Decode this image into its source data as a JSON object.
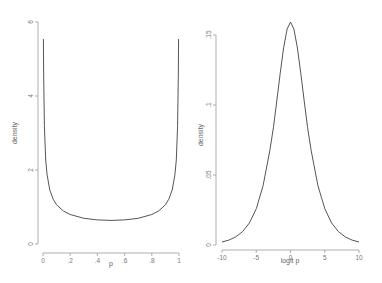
{
  "chart_data": [
    {
      "type": "line",
      "title": "",
      "xlabel": "p",
      "ylabel": "density",
      "xlim": [
        0,
        1
      ],
      "ylim": [
        0,
        6
      ],
      "grid": false,
      "legend": null,
      "x_ticks": [
        {
          "value": 0,
          "label": "0"
        },
        {
          "value": 0.2,
          "label": ".2"
        },
        {
          "value": 0.4,
          "label": ".4"
        },
        {
          "value": 0.6,
          "label": ".6"
        },
        {
          "value": 0.8,
          "label": ".8"
        },
        {
          "value": 1,
          "label": "1"
        }
      ],
      "y_ticks": [
        {
          "value": 0,
          "label": "0"
        },
        {
          "value": 2,
          "label": "2"
        },
        {
          "value": 4,
          "label": "4"
        },
        {
          "value": 6,
          "label": "6"
        }
      ],
      "series": [
        {
          "name": "Beta(0.5,0.5) density",
          "x": [
            0.0033,
            0.005,
            0.01,
            0.02,
            0.03,
            0.05,
            0.075,
            0.1,
            0.15,
            0.2,
            0.3,
            0.4,
            0.5,
            0.6,
            0.7,
            0.8,
            0.85,
            0.9,
            0.925,
            0.95,
            0.97,
            0.98,
            0.99,
            0.995,
            0.9967
          ],
          "values": [
            5.54,
            4.51,
            3.2,
            2.27,
            1.87,
            1.46,
            1.21,
            1.06,
            0.891,
            0.796,
            0.695,
            0.65,
            0.637,
            0.65,
            0.695,
            0.796,
            0.891,
            1.06,
            1.21,
            1.46,
            1.87,
            2.27,
            3.2,
            4.51,
            5.54
          ]
        }
      ]
    },
    {
      "type": "line",
      "title": "",
      "xlabel": "logit p",
      "ylabel": "density",
      "xlim": [
        -10,
        10
      ],
      "ylim": [
        0,
        0.16
      ],
      "grid": false,
      "legend": null,
      "x_ticks": [
        {
          "value": -10,
          "label": "-10"
        },
        {
          "value": -5,
          "label": "-5"
        },
        {
          "value": 0,
          "label": "0"
        },
        {
          "value": 5,
          "label": "5"
        },
        {
          "value": 10,
          "label": "10"
        }
      ],
      "y_ticks": [
        {
          "value": 0,
          "label": "0"
        },
        {
          "value": 0.05,
          "label": ".05"
        },
        {
          "value": 0.1,
          "label": ".1"
        },
        {
          "value": 0.15,
          "label": ".15"
        }
      ],
      "series": [
        {
          "name": "density of logit p",
          "x": [
            -10,
            -9,
            -8,
            -7,
            -6,
            -5,
            -4,
            -3,
            -2.5,
            -2,
            -1.5,
            -1,
            -0.5,
            0,
            0.5,
            1,
            1.5,
            2,
            2.5,
            3,
            4,
            5,
            6,
            7,
            8,
            9,
            10
          ],
          "values": [
            0.00214,
            0.00353,
            0.0058,
            0.00954,
            0.0157,
            0.0259,
            0.0424,
            0.0677,
            0.0838,
            0.1029,
            0.1226,
            0.1408,
            0.1543,
            0.1592,
            0.1543,
            0.1408,
            0.1226,
            0.1029,
            0.0838,
            0.0677,
            0.0424,
            0.0259,
            0.0157,
            0.00954,
            0.0058,
            0.00353,
            0.00214
          ]
        }
      ]
    }
  ],
  "panels": [
    {
      "frame": {
        "x0": 43,
        "x1": 179,
        "y0": 244,
        "y1": 22,
        "axis_x": 38,
        "axis_y": 253
      },
      "ylabel_pos": {
        "x": 17,
        "y": 133
      },
      "xlabel_pos": {
        "x": 111,
        "y": 266
      }
    },
    {
      "frame": {
        "x0": 222,
        "x1": 359,
        "y0": 245,
        "y1": 22.2,
        "axis_x": 216,
        "axis_y": 250
      },
      "ylabel_pos": {
        "x": 203,
        "y": 135
      },
      "xlabel_pos": {
        "x": 290,
        "y": 263
      }
    }
  ]
}
